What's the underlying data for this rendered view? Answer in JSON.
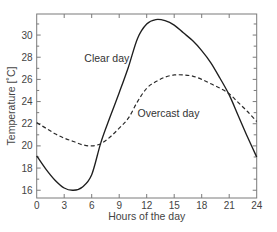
{
  "chart_data": {
    "type": "line",
    "title": "",
    "xlabel": "Hours of the day",
    "ylabel": "Temperature [˚C]",
    "xlim": [
      0,
      24
    ],
    "ylim": [
      15.3,
      31.9
    ],
    "grid": false,
    "legend": "inline annotations",
    "x_ticks": [
      0,
      3,
      6,
      9,
      12,
      15,
      18,
      21,
      24
    ],
    "y_ticks": [
      16,
      18,
      20,
      22,
      24,
      26,
      28,
      30
    ],
    "y_minor_ticks": [
      17,
      19,
      21,
      23,
      25,
      27,
      29,
      31
    ],
    "x": [
      0,
      1,
      2,
      3,
      4,
      5,
      6,
      7,
      8,
      9,
      10,
      11,
      12,
      13,
      14,
      15,
      16,
      17,
      18,
      19,
      20,
      21,
      22,
      23,
      24
    ],
    "series": [
      {
        "name": "Clear day",
        "style": "solid",
        "color": "#1e1e1e",
        "values": [
          19.1,
          17.9,
          16.9,
          16.2,
          16.0,
          16.3,
          17.4,
          20.3,
          22.6,
          24.8,
          27.1,
          29.7,
          31.0,
          31.4,
          31.3,
          30.9,
          30.2,
          29.5,
          28.6,
          27.5,
          26.1,
          24.6,
          22.7,
          20.8,
          19.0
        ]
      },
      {
        "name": "Overcast day",
        "style": "dashed",
        "color": "#2a2a2a",
        "values": [
          22.1,
          21.6,
          21.1,
          20.7,
          20.4,
          20.1,
          20.0,
          20.2,
          20.8,
          21.6,
          22.5,
          24.0,
          25.2,
          25.8,
          26.2,
          26.4,
          26.4,
          26.3,
          26.0,
          25.6,
          25.2,
          24.7,
          23.9,
          23.1,
          22.2
        ]
      }
    ],
    "annotations": [
      {
        "text": "Clear day",
        "x": 5.2,
        "y": 27.6
      },
      {
        "text": "Overcast day",
        "x": 11.0,
        "y": 22.6
      }
    ]
  }
}
